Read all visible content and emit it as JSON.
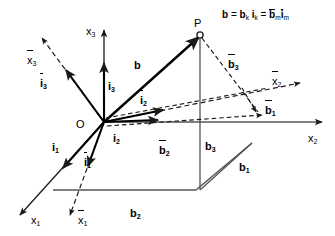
{
  "figure": {
    "formula": {
      "lhs": "b",
      "eq1": "=",
      "term1_coef": "b",
      "term1_coef_sub": "k",
      "term1_unit": "i",
      "term1_unit_sub": "k",
      "eq2": "=",
      "term2_coef": "b",
      "term2_coef_sub": "m",
      "term2_unit": "i",
      "term2_unit_sub": "m",
      "plain": "b = b_k i_k = b̄_m ī_m"
    },
    "colors": {
      "stroke": "#1a1a1a",
      "axis": "#333333",
      "background": "#ffffff",
      "text": "#000000"
    },
    "points": {
      "origin_label": "O",
      "p_label": "P"
    },
    "axes": [
      {
        "id": "x1",
        "label": "x",
        "sub": "1",
        "overbar": false,
        "style": "solid"
      },
      {
        "id": "x2",
        "label": "x",
        "sub": "2",
        "overbar": false,
        "style": "solid"
      },
      {
        "id": "x3",
        "label": "x",
        "sub": "3",
        "overbar": false,
        "style": "solid"
      },
      {
        "id": "x1b",
        "label": "x",
        "sub": "1",
        "overbar": true,
        "style": "dashed"
      },
      {
        "id": "x2b",
        "label": "x",
        "sub": "2",
        "overbar": true,
        "style": "dashed"
      },
      {
        "id": "x3b",
        "label": "x",
        "sub": "3",
        "overbar": true,
        "style": "dashed"
      }
    ],
    "unit_vectors": [
      {
        "id": "i1",
        "label": "i",
        "sub": "1",
        "overbar": false
      },
      {
        "id": "i2",
        "label": "i",
        "sub": "2",
        "overbar": false
      },
      {
        "id": "i3",
        "label": "i",
        "sub": "3",
        "overbar": false
      },
      {
        "id": "i1b",
        "label": "i",
        "sub": "1",
        "overbar": true
      },
      {
        "id": "i2b",
        "label": "i",
        "sub": "2",
        "overbar": true
      },
      {
        "id": "i3b",
        "label": "i",
        "sub": "3",
        "overbar": true
      }
    ],
    "vector": {
      "id": "b",
      "label": "b",
      "overbar": false,
      "bold": true
    },
    "components": [
      {
        "id": "b1",
        "label": "b",
        "sub": "1",
        "overbar": false
      },
      {
        "id": "b2",
        "label": "b",
        "sub": "2",
        "overbar": false
      },
      {
        "id": "b3",
        "label": "b",
        "sub": "3",
        "overbar": false
      },
      {
        "id": "b1b",
        "label": "b",
        "sub": "1",
        "overbar": true
      },
      {
        "id": "b2b",
        "label": "b",
        "sub": "2",
        "overbar": true
      },
      {
        "id": "b3b",
        "label": "b",
        "sub": "3",
        "overbar": true
      }
    ]
  }
}
